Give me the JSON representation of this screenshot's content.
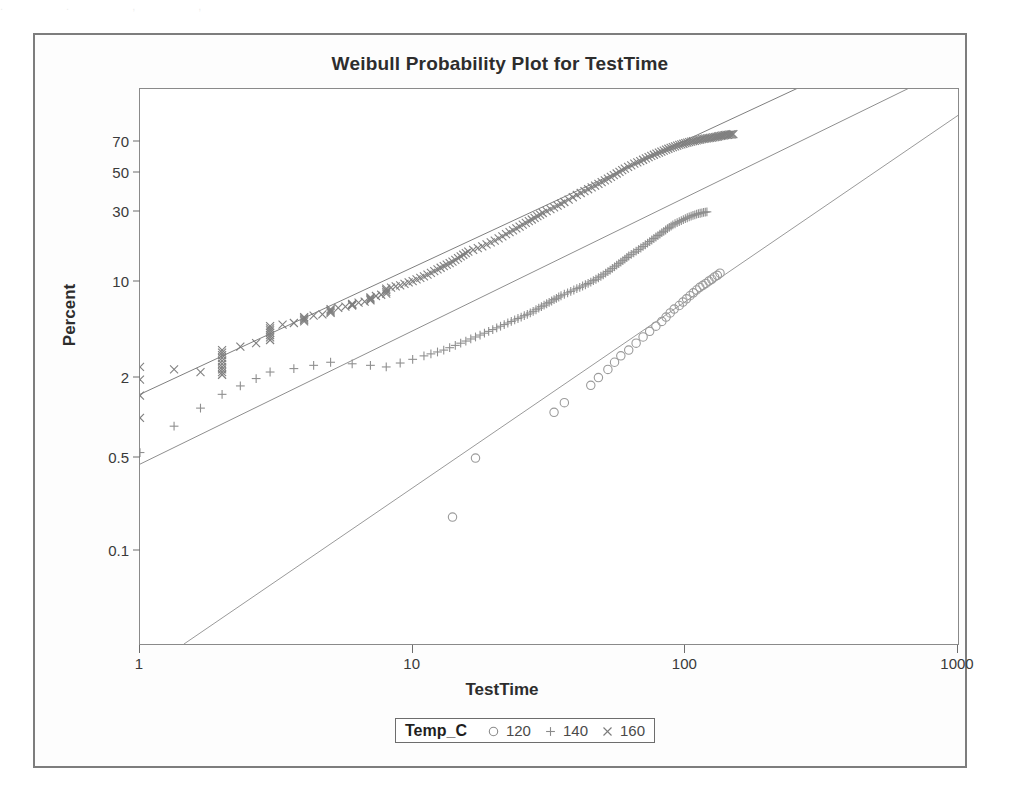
{
  "page": {
    "top_artifact": ". .    ,                                                                                          ,"
  },
  "chart_data": {
    "type": "scatter",
    "title": "Weibull Probability Plot for TestTime",
    "xlabel": "TestTime",
    "ylabel": "Percent",
    "xscale": "log",
    "yscale": "weibull-probability",
    "xlim": [
      1,
      1000
    ],
    "ylim": [
      0.02,
      95
    ],
    "grid": false,
    "xticks": [
      "1",
      "10",
      "100",
      "1000"
    ],
    "xtick_values": [
      1,
      10,
      100,
      1000
    ],
    "yticks": [
      "70",
      "50",
      "30",
      "10",
      "2",
      "0.5",
      "0.1"
    ],
    "ytick_values": [
      70,
      50,
      30,
      10,
      2,
      0.5,
      0.1
    ],
    "legend": {
      "title": "Temp_C",
      "position": "below-axis",
      "entries": [
        {
          "label": "120",
          "marker": "circle-marker",
          "color": "#8a8a8a"
        },
        {
          "label": "140",
          "marker": "plus-marker",
          "color": "#8a8a8a"
        },
        {
          "label": "160",
          "marker": "cross-marker",
          "color": "#7a7a7a"
        }
      ]
    },
    "series": [
      {
        "name": "120",
        "marker": "circle-marker",
        "color": "#9a9a9a",
        "fit_line": {
          "x": [
            1.45,
            1000
          ],
          "y": [
            0.02,
            85
          ]
        },
        "points": [
          [
            14,
            0.18
          ],
          [
            17,
            0.5
          ],
          [
            33,
            1.1
          ],
          [
            36,
            1.3
          ],
          [
            45,
            1.75
          ],
          [
            48,
            2.0
          ],
          [
            52,
            2.3
          ],
          [
            55,
            2.6
          ],
          [
            58,
            2.9
          ],
          [
            62,
            3.2
          ],
          [
            66,
            3.6
          ],
          [
            70,
            4.0
          ],
          [
            74,
            4.4
          ],
          [
            78,
            4.8
          ],
          [
            82,
            5.2
          ],
          [
            85,
            5.6
          ],
          [
            88,
            6.0
          ],
          [
            91,
            6.4
          ],
          [
            95,
            6.8
          ],
          [
            98,
            7.2
          ],
          [
            101,
            7.6
          ],
          [
            104,
            8.0
          ],
          [
            107,
            8.4
          ],
          [
            110,
            8.8
          ],
          [
            113,
            9.2
          ],
          [
            116,
            9.5
          ],
          [
            119,
            9.8
          ],
          [
            122,
            10.2
          ],
          [
            125,
            10.5
          ],
          [
            128,
            10.9
          ],
          [
            131,
            11.2
          ],
          [
            134,
            11.6
          ]
        ]
      },
      {
        "name": "140",
        "marker": "plus-marker",
        "color": "#8f8f8f",
        "fit_line": {
          "x": [
            1,
            1000
          ],
          "y": [
            0.45,
            99
          ]
        },
        "points": [
          [
            1,
            0.55
          ],
          [
            2,
            1.5
          ],
          [
            3,
            2.2
          ],
          [
            5,
            2.6
          ],
          [
            8,
            2.4
          ],
          [
            11,
            2.9
          ],
          [
            13,
            3.2
          ],
          [
            15,
            3.6
          ],
          [
            17,
            4.0
          ],
          [
            19,
            4.4
          ],
          [
            21,
            4.8
          ],
          [
            23,
            5.2
          ],
          [
            25,
            5.6
          ],
          [
            27,
            6.0
          ],
          [
            29,
            6.5
          ],
          [
            31,
            7.0
          ],
          [
            33,
            7.5
          ],
          [
            35,
            8.0
          ],
          [
            38,
            8.6
          ],
          [
            41,
            9.2
          ],
          [
            44,
            9.8
          ],
          [
            47,
            10.5
          ],
          [
            50,
            11.3
          ],
          [
            53,
            12.2
          ],
          [
            56,
            13.2
          ],
          [
            59,
            14.2
          ],
          [
            62,
            15.3
          ],
          [
            66,
            16.5
          ],
          [
            70,
            17.8
          ],
          [
            74,
            19.2
          ],
          [
            78,
            20.6
          ],
          [
            82,
            22.0
          ],
          [
            86,
            23.4
          ],
          [
            90,
            24.8
          ],
          [
            95,
            26.0
          ],
          [
            100,
            27.2
          ],
          [
            105,
            28.2
          ],
          [
            110,
            29.0
          ],
          [
            115,
            29.6
          ],
          [
            120,
            30.0
          ]
        ]
      },
      {
        "name": "160",
        "marker": "cross-marker",
        "color": "#7f7f7f",
        "fit_line": {
          "x": [
            1,
            300
          ],
          "y": [
            1.5,
            97
          ]
        },
        "points": [
          [
            1,
            1.0
          ],
          [
            1,
            2.4
          ],
          [
            2,
            2.1
          ],
          [
            2,
            2.4
          ],
          [
            2,
            2.8
          ],
          [
            2,
            3.2
          ],
          [
            3,
            3.8
          ],
          [
            3,
            4.3
          ],
          [
            3,
            4.8
          ],
          [
            4,
            5.2
          ],
          [
            4,
            5.6
          ],
          [
            5,
            6.0
          ],
          [
            5,
            6.4
          ],
          [
            6,
            6.8
          ],
          [
            6,
            7.0
          ],
          [
            7,
            7.4
          ],
          [
            7,
            7.8
          ],
          [
            8,
            8.3
          ],
          [
            8,
            9.0
          ],
          [
            9,
            9.5
          ],
          [
            10,
            10.2
          ],
          [
            11,
            11.0
          ],
          [
            12,
            12.0
          ],
          [
            13,
            13.0
          ],
          [
            14,
            14.0
          ],
          [
            15,
            15.2
          ],
          [
            16,
            16.4
          ],
          [
            18,
            17.8
          ],
          [
            20,
            19.5
          ],
          [
            22,
            21.5
          ],
          [
            24,
            23.5
          ],
          [
            26,
            25.5
          ],
          [
            28,
            27.5
          ],
          [
            30,
            29.5
          ],
          [
            33,
            32.0
          ],
          [
            36,
            34.5
          ],
          [
            40,
            38.0
          ],
          [
            44,
            41.0
          ],
          [
            48,
            44.0
          ],
          [
            52,
            47.0
          ],
          [
            56,
            50.0
          ],
          [
            60,
            53.0
          ],
          [
            65,
            56.0
          ],
          [
            70,
            58.5
          ],
          [
            75,
            61.0
          ],
          [
            80,
            63.0
          ],
          [
            85,
            65.0
          ],
          [
            90,
            66.5
          ],
          [
            95,
            68.0
          ],
          [
            100,
            69.0
          ],
          [
            105,
            70.0
          ],
          [
            110,
            70.8
          ],
          [
            115,
            71.5
          ],
          [
            120,
            72.0
          ],
          [
            125,
            72.5
          ],
          [
            130,
            73.0
          ],
          [
            135,
            73.5
          ],
          [
            140,
            74.0
          ],
          [
            145,
            74.3
          ],
          [
            150,
            74.6
          ]
        ]
      }
    ]
  }
}
